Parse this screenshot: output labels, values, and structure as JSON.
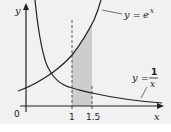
{
  "diagram": {
    "axes": {
      "x_label": "x",
      "y_label": "y",
      "origin_label": "0",
      "x_ticks": [
        "1",
        "1.5"
      ]
    },
    "curves": [
      {
        "name": "exp",
        "label_lhs": "y",
        "label_eq": "=",
        "label_base": "e",
        "label_exp": "x"
      },
      {
        "name": "reciprocal",
        "label_lhs": "y",
        "label_eq": "=",
        "label_num": "1",
        "label_den": "x"
      }
    ],
    "shaded_region": {
      "from": "1",
      "to": "1.5",
      "color": "#cdcdcd"
    },
    "colors": {
      "background": "#f1f1f1",
      "line": "#222222"
    }
  }
}
